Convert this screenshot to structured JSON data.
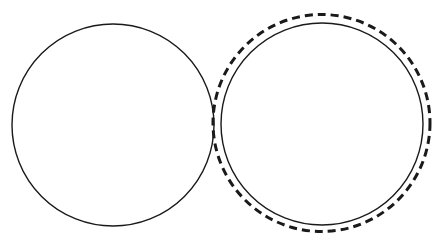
{
  "figure": {
    "width": 445,
    "height": 246,
    "background": "#ffffff",
    "stroke_color": "#1a1a1a",
    "shapes": [
      {
        "id": "left-circle",
        "type": "circle",
        "style": "solid",
        "cx": 113,
        "cy": 125,
        "r": 101,
        "stroke_width": 1.4
      },
      {
        "id": "right-circle",
        "type": "circle",
        "style": "solid",
        "cx": 322,
        "cy": 124,
        "r": 101,
        "stroke_width": 1.4
      },
      {
        "id": "right-dashed-circle",
        "type": "circle",
        "style": "dashed",
        "cx": 321.5,
        "cy": 123,
        "r": 108.5,
        "stroke_width": 3,
        "dasharray": "8 5"
      }
    ]
  }
}
